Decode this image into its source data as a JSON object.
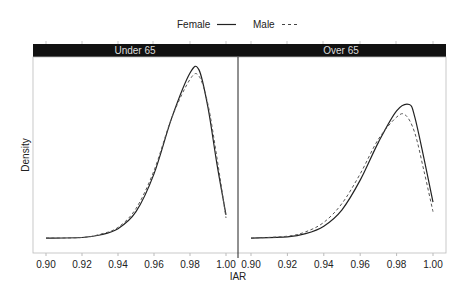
{
  "chart_data": {
    "type": "line",
    "title": "",
    "xlabel": "IAR",
    "ylabel": "Density",
    "xlim": [
      0.895,
      1.005
    ],
    "x_ticks": [
      "0.90",
      "0.92",
      "0.94",
      "0.96",
      "0.98",
      "1.00"
    ],
    "legend": {
      "position": "top",
      "entries": [
        {
          "name": "Female",
          "style": "solid"
        },
        {
          "name": "Male",
          "style": "dashed"
        }
      ]
    },
    "grid": false,
    "panels": [
      {
        "label": "Under 65",
        "series": [
          {
            "name": "Female",
            "style": "solid",
            "x": [
              0.9,
              0.92,
              0.93,
              0.94,
              0.95,
              0.96,
              0.97,
              0.98,
              0.985,
              0.99,
              0.995,
              1.0
            ],
            "y": [
              0.3,
              0.4,
              0.8,
              1.8,
              4.5,
              10.5,
              19.5,
              26.5,
              27.0,
              21.0,
              12.0,
              4.0
            ]
          },
          {
            "name": "Male",
            "style": "dashed",
            "x": [
              0.9,
              0.92,
              0.93,
              0.94,
              0.95,
              0.96,
              0.97,
              0.98,
              0.985,
              0.99,
              0.995,
              1.0
            ],
            "y": [
              0.3,
              0.4,
              0.9,
              2.0,
              5.0,
              11.0,
              19.5,
              25.5,
              26.0,
              21.5,
              13.0,
              3.5
            ]
          }
        ]
      },
      {
        "label": "Over 65",
        "series": [
          {
            "name": "Female",
            "style": "solid",
            "x": [
              0.9,
              0.92,
              0.93,
              0.94,
              0.95,
              0.96,
              0.97,
              0.98,
              0.987,
              0.99,
              0.995,
              1.0
            ],
            "y": [
              0.3,
              0.5,
              1.0,
              2.2,
              4.8,
              9.5,
              15.5,
              20.5,
              21.5,
              19.5,
              13.0,
              6.0
            ]
          },
          {
            "name": "Male",
            "style": "dashed",
            "x": [
              0.9,
              0.92,
              0.93,
              0.94,
              0.95,
              0.96,
              0.97,
              0.98,
              0.985,
              0.99,
              0.995,
              1.0
            ],
            "y": [
              0.3,
              0.6,
              1.3,
              2.8,
              5.8,
              10.5,
              16.0,
              19.5,
              19.8,
              17.0,
              11.0,
              4.5
            ]
          }
        ]
      }
    ]
  }
}
